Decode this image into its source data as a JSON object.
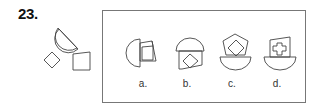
{
  "question": {
    "number": "23."
  },
  "given_pieces": [
    {
      "shape": "half-circle"
    },
    {
      "shape": "diamond-square"
    },
    {
      "shape": "trapezoid-quadrilateral"
    }
  ],
  "options": [
    {
      "label": "a.",
      "description": "half-circle left with tilted quadrilateral and square overlapped at right"
    },
    {
      "label": "b.",
      "description": "half-circle dome on top with quadrilateral containing a diamond below"
    },
    {
      "label": "c.",
      "description": "half-circle bowl at bottom with pentagon and diamond on top"
    },
    {
      "label": "d.",
      "description": "half-circle bowl at bottom with quadrilateral containing a cross shape on top"
    }
  ],
  "colors": {
    "stroke": "#444444",
    "frame": "#777777",
    "text": "#111111"
  }
}
